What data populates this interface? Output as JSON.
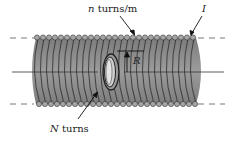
{
  "diagram": {
    "labels": {
      "turns_per_meter_var": "n",
      "turns_per_meter_unit": " turns/m",
      "current": "I",
      "radius": "R",
      "inner_turns_var": "N",
      "inner_turns_unit": " turns"
    },
    "colors": {
      "body": "#8a8a8a",
      "body_dark": "#6d6d6d",
      "winding_line": "#2b2b2b",
      "wire": "#9a9a9a",
      "dashed": "#555555",
      "text": "#222222"
    }
  }
}
